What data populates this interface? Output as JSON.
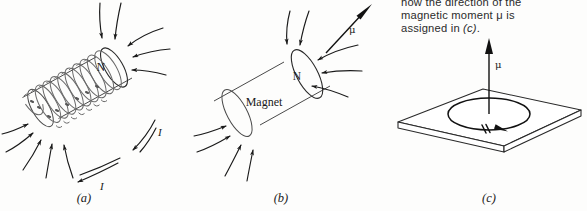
{
  "figure": {
    "caption": {
      "line1": "how the direction of the",
      "line2_pre": "magnetic moment ",
      "line2_sym": "μ",
      "line2_post": " is",
      "line3_pre": "assigned in ",
      "line3_em": "(c)",
      "line3_post": "."
    },
    "panels": [
      {
        "id": "a",
        "label": "(a)",
        "name": "solenoid-panel",
        "object_label": "",
        "pole_label": "N",
        "current_labels": [
          "I",
          "I"
        ],
        "description": "current-carrying solenoid with magnetic field lines"
      },
      {
        "id": "b",
        "label": "(b)",
        "name": "bar-magnet-panel",
        "object_label": "Magnet",
        "pole_label": "N",
        "moment_label": "μ",
        "description": "bar magnet with magnetic field lines and magnetic moment vector"
      },
      {
        "id": "c",
        "label": "(c)",
        "name": "current-loop-panel",
        "object_label": "",
        "moment_label": "μ",
        "description": "current loop in a plane with magnetic moment vector normal to plane"
      }
    ],
    "colors": {
      "background": "#fdfdfc",
      "ink": "#1a1a1a",
      "field_line": "#1a1a1a",
      "body_outline": "#4a4a4a",
      "coil": "#6a6a6a",
      "caption_text": "#2b2b2b"
    }
  }
}
